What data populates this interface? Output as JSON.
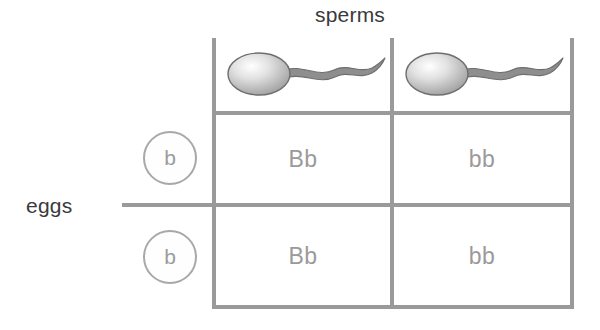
{
  "diagram": {
    "type": "punnett-square",
    "axis_labels": {
      "columns": "sperms",
      "rows": "eggs"
    },
    "column_headers": [
      {
        "icon": "sperm-icon",
        "allele": "B"
      },
      {
        "icon": "sperm-icon",
        "allele": "b"
      }
    ],
    "row_headers": [
      {
        "icon": "egg-circle-icon",
        "allele": "b"
      },
      {
        "icon": "egg-circle-icon",
        "allele": "b"
      }
    ],
    "cells": [
      [
        "Bb",
        "bb"
      ],
      [
        "Bb",
        "bb"
      ]
    ],
    "colors": {
      "grid_line": "#9a9a9a",
      "cell_text": "#9a9a9a",
      "header_text": "#3a3a3a",
      "circle_stroke": "#a8a8a8",
      "circle_text": "#9b9b9b",
      "sperm_body": "#8e8e8e",
      "background": "#ffffff"
    },
    "artifact_text": "        "
  }
}
